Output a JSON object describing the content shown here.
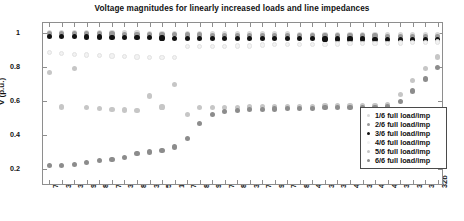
{
  "chart_data": {
    "type": "scatter",
    "title": "Voltage magnitudes for linearly increased loads and line impedances",
    "xlabel": "",
    "ylabel": "V (p.u.)",
    "ylim": [
      0.1,
      1.06
    ],
    "yticks": [
      0.2,
      0.4,
      0.6,
      0.8,
      1
    ],
    "ytick_labels": [
      "0.2",
      "0.4",
      "0.6",
      "0.8",
      "1"
    ],
    "grid": false,
    "legend_position": "lower right",
    "categories": [
      "75a",
      "34a",
      "33a",
      "92a",
      "80a",
      "71a",
      "320a",
      "84a",
      "32a",
      "52a",
      "11c",
      "75c",
      "84c",
      "92c",
      "71c",
      "80c",
      "320c",
      "75b",
      "92b",
      "71b",
      "80b",
      "46c",
      "34c",
      "33c",
      "45c",
      "32c",
      "46b",
      "45b",
      "320b",
      "34b",
      "33b",
      "32b"
    ],
    "series": [
      {
        "name": "1/6 full load/imp",
        "color": "#d9d9d9",
        "values": [
          1.005,
          1.004,
          1.003,
          1.003,
          1.002,
          1.002,
          1.001,
          1.001,
          1.0,
          1.0,
          0.999,
          0.999,
          0.998,
          0.998,
          0.997,
          0.997,
          0.996,
          0.996,
          0.995,
          0.995,
          0.994,
          0.994,
          0.993,
          0.993,
          0.993,
          0.992,
          0.992,
          0.992,
          0.991,
          0.991,
          0.991,
          0.99
        ]
      },
      {
        "name": "2/6 full load/imp",
        "color": "#9a9a9a",
        "values": [
          1.0,
          0.999,
          0.998,
          0.997,
          0.996,
          0.995,
          0.994,
          0.993,
          0.992,
          0.991,
          0.99,
          0.989,
          0.989,
          0.988,
          0.988,
          0.987,
          0.987,
          0.986,
          0.986,
          0.985,
          0.985,
          0.984,
          0.984,
          0.984,
          0.983,
          0.983,
          0.983,
          0.982,
          0.982,
          0.982,
          0.981,
          0.981
        ]
      },
      {
        "name": "3/6 full load/imp",
        "color": "#111111",
        "values": [
          0.982,
          0.98,
          0.979,
          0.978,
          0.977,
          0.976,
          0.975,
          0.974,
          0.973,
          0.972,
          0.971,
          0.971,
          0.97,
          0.97,
          0.969,
          0.969,
          0.968,
          0.968,
          0.968,
          0.967,
          0.967,
          0.967,
          0.966,
          0.966,
          0.966,
          0.966,
          0.965,
          0.965,
          0.965,
          0.965,
          0.965,
          0.964
        ]
      },
      {
        "name": "4/6 full load/imp",
        "color": "#f2f2f2",
        "values": [
          0.888,
          0.88,
          0.876,
          0.872,
          0.869,
          0.866,
          0.862,
          0.86,
          0.858,
          0.856,
          0.855,
          0.92,
          0.921,
          0.922,
          0.923,
          0.924,
          0.925,
          0.93,
          0.931,
          0.932,
          0.933,
          0.934,
          0.935,
          0.936,
          0.938,
          0.939,
          0.94,
          0.941,
          0.942,
          0.944,
          0.946,
          0.948
        ]
      },
      {
        "name": "5/6 full load/imp",
        "color": "#c6c6c6",
        "values": [
          0.768,
          0.565,
          0.79,
          0.56,
          0.556,
          0.552,
          0.548,
          0.545,
          0.63,
          0.565,
          0.7,
          0.52,
          0.56,
          0.562,
          0.563,
          0.564,
          0.565,
          0.566,
          0.567,
          0.568,
          0.569,
          0.57,
          0.571,
          0.572,
          0.573,
          0.574,
          0.575,
          0.577,
          0.64,
          0.72,
          0.79,
          0.86
        ]
      },
      {
        "name": "6/6 full load/imp",
        "color": "#8c8c8c",
        "values": [
          0.22,
          0.222,
          0.228,
          0.24,
          0.25,
          0.258,
          0.268,
          0.29,
          0.3,
          0.31,
          0.33,
          0.38,
          0.47,
          0.52,
          0.54,
          0.546,
          0.55,
          0.552,
          0.554,
          0.556,
          0.558,
          0.558,
          0.56,
          0.561,
          0.562,
          0.563,
          0.564,
          0.565,
          0.6,
          0.66,
          0.73,
          0.8
        ]
      }
    ]
  },
  "legend": {
    "items": [
      {
        "label": "1/6 full load/imp",
        "color": "#d9d9d9"
      },
      {
        "label": "2/6 full load/imp",
        "color": "#9a9a9a"
      },
      {
        "label": "3/6 full load/imp",
        "color": "#111111"
      },
      {
        "label": "4/6 full load/imp",
        "color": "#f2f2f2"
      },
      {
        "label": "5/6 full load/imp",
        "color": "#c6c6c6"
      },
      {
        "label": "6/6 full load/imp",
        "color": "#8c8c8c"
      }
    ]
  },
  "axes": {
    "frame_color": "#8e8e8e"
  }
}
